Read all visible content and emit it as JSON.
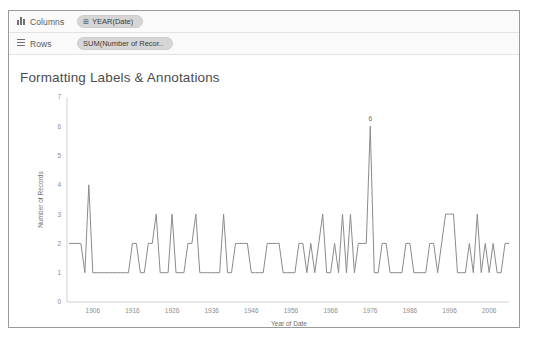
{
  "window": {
    "background": "#ffffff",
    "frame_border_color": "#9a9a9a"
  },
  "shelves": [
    {
      "name": "columns",
      "label": "Columns",
      "icon": "columns-bars-icon",
      "pill": {
        "text": "YEAR(Date)",
        "icon": "⊞",
        "color": "#d6d6d6"
      }
    },
    {
      "name": "rows",
      "label": "Rows",
      "icon": "rows-lines-icon",
      "pill": {
        "text": "SUM(Number of Recor..",
        "icon": "",
        "color": "#d6d6d6"
      }
    }
  ],
  "view": {
    "title": "Formatting Labels & Annotations",
    "annotation_label": "6",
    "annotation_color": "#6a6a6a",
    "line_color": "#8b8b8b",
    "axis_color": "#d0d0d0"
  },
  "chart_data": {
    "type": "line",
    "title": "Formatting Labels & Annotations",
    "xlabel": "Year of Date",
    "ylabel": "Number of Records",
    "xlim": [
      1900,
      2011
    ],
    "ylim": [
      0,
      7
    ],
    "yticks": [
      0,
      1,
      2,
      3,
      4,
      5,
      6,
      7
    ],
    "xticks": [
      1906,
      1916,
      1926,
      1936,
      1946,
      1956,
      1966,
      1976,
      1986,
      1996,
      2006
    ],
    "grid": false,
    "legend": "none",
    "annotations": [
      {
        "text": "6",
        "x": 1976,
        "y": 6
      }
    ],
    "series": [
      {
        "name": "SUM(Number of Records)",
        "x": [
          1900,
          1901,
          1902,
          1903,
          1904,
          1905,
          1906,
          1907,
          1908,
          1909,
          1910,
          1911,
          1912,
          1913,
          1914,
          1915,
          1916,
          1917,
          1918,
          1919,
          1920,
          1921,
          1922,
          1923,
          1924,
          1925,
          1926,
          1927,
          1928,
          1929,
          1930,
          1931,
          1932,
          1933,
          1934,
          1935,
          1936,
          1937,
          1938,
          1939,
          1940,
          1941,
          1942,
          1943,
          1944,
          1945,
          1946,
          1947,
          1948,
          1949,
          1950,
          1951,
          1952,
          1953,
          1954,
          1955,
          1956,
          1957,
          1958,
          1959,
          1960,
          1961,
          1962,
          1963,
          1964,
          1965,
          1966,
          1967,
          1968,
          1969,
          1970,
          1971,
          1972,
          1973,
          1974,
          1975,
          1976,
          1977,
          1978,
          1979,
          1980,
          1981,
          1982,
          1983,
          1984,
          1985,
          1986,
          1987,
          1988,
          1989,
          1990,
          1991,
          1992,
          1993,
          1994,
          1995,
          1996,
          1997,
          1998,
          1999,
          2000,
          2001,
          2002,
          2003,
          2004,
          2005,
          2006,
          2007,
          2008,
          2009,
          2010,
          2011
        ],
        "y": [
          2,
          2,
          2,
          2,
          1,
          4,
          1,
          1,
          1,
          1,
          1,
          1,
          1,
          1,
          1,
          1,
          2,
          2,
          1,
          1,
          2,
          2,
          3,
          1,
          1,
          1,
          3,
          1,
          1,
          1,
          2,
          2,
          3,
          1,
          1,
          1,
          1,
          1,
          1,
          3,
          1,
          1,
          2,
          2,
          2,
          2,
          1,
          1,
          1,
          1,
          2,
          2,
          2,
          2,
          1,
          1,
          1,
          1,
          2,
          2,
          1,
          2,
          1,
          2,
          3,
          1,
          1,
          2,
          1,
          3,
          1,
          3,
          1,
          2,
          2,
          2,
          6,
          1,
          1,
          2,
          2,
          1,
          1,
          1,
          1,
          2,
          2,
          1,
          1,
          1,
          1,
          2,
          2,
          1,
          2,
          3,
          3,
          3,
          1,
          1,
          1,
          2,
          1,
          3,
          1,
          2,
          1,
          2,
          1,
          1,
          2,
          2
        ]
      }
    ]
  }
}
